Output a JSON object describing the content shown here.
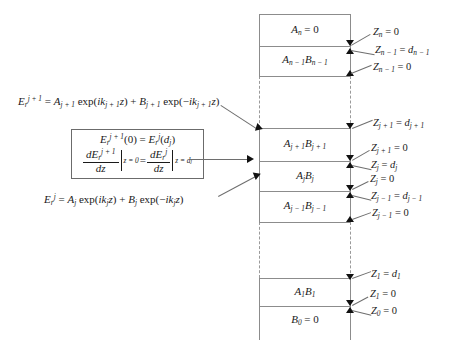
{
  "figure": {
    "type": "multilayer-stack-diagram",
    "background": "#ffffff",
    "line_color": "#8c8c8c",
    "text_color": "#1a1a1a"
  },
  "equations": {
    "top_field": {
      "lhs": "E",
      "lhs_sup": "j + 1",
      "lhs_sub": "r",
      "full_text": "E_r^{j+1} = A_{j+1} exp(ik_{j+1} z) + B_{j+1} exp(-ik_{j+1} z)"
    },
    "bottom_field": {
      "full_text": "E_r^{j} = A_{j} exp(ik_{j} z) + B_{j} exp(-ik_{j} z)"
    },
    "boundary_box": {
      "line1": "E_r^{j+1}(0) = E_r^{j}(d_j)",
      "line2": "dE_r^{j+1}/dz |_{z=0} = dE_r^{j}/dz |_{z=d_j}"
    }
  },
  "layers": [
    {
      "id": "layer-n",
      "caption": "A_n = 0"
    },
    {
      "id": "layer-n-1",
      "caption": "A_{n-1} B_{n-1}"
    },
    {
      "id": "layer-j-plus-1",
      "caption": "A_{j+1} B_{j+1}"
    },
    {
      "id": "layer-j",
      "caption": "A_j B_j"
    },
    {
      "id": "layer-j-minus-1",
      "caption": "A_{j-1} B_{j-1}"
    },
    {
      "id": "layer-1",
      "caption": "A_1 B_1"
    },
    {
      "id": "layer-0",
      "caption": "B_0 = 0"
    }
  ],
  "coordinate_labels": [
    {
      "id": "z-n",
      "text": "Z_n = 0"
    },
    {
      "id": "z-n-1-d",
      "text": "Z_{n-1} = d_{n-1}"
    },
    {
      "id": "z-n-1-zero",
      "text": "Z_{n-1} = 0"
    },
    {
      "id": "z-j-plus-1-d",
      "text": "Z_{j+1} = d_{j+1}"
    },
    {
      "id": "z-j-plus-1-zero",
      "text": "Z_{j+1} = 0"
    },
    {
      "id": "z-j-d",
      "text": "Z_j = d_j"
    },
    {
      "id": "z-j-zero",
      "text": "Z_j = 0"
    },
    {
      "id": "z-j-minus-1-d",
      "text": "Z_{j-1} = d_{j-1}"
    },
    {
      "id": "z-j-minus-1-zero",
      "text": "Z_{j-1} = 0"
    },
    {
      "id": "z-1-d",
      "text": "Z_1 = d_1"
    },
    {
      "id": "z-1-zero",
      "text": "Z_1 = 0"
    },
    {
      "id": "z-0-zero",
      "text": "Z_0 = 0"
    }
  ]
}
